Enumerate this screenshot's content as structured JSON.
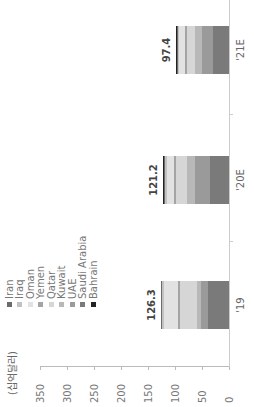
{
  "chart_data": {
    "type": "bar",
    "stacked": true,
    "orientation": "vertical (image rotated 90° counter-clockwise)",
    "title": "",
    "unit_label": "(십억달러)",
    "xlabel": "",
    "ylabel": "(십억달러)",
    "ylim": [
      0,
      350
    ],
    "y_ticks": [
      0,
      50,
      100,
      150,
      200,
      250,
      300,
      350
    ],
    "grid": false,
    "legend_position": "top",
    "categories": [
      "'19",
      "'20E",
      "'21E"
    ],
    "totals": [
      126.3,
      121.2,
      97.4
    ],
    "series": [
      {
        "name": "Saudi Arabia",
        "color": "#7a7a7a",
        "values": [
          38,
          35,
          29
        ]
      },
      {
        "name": "UAE",
        "color": "#9a9a9a",
        "values": [
          13,
          27,
          21
        ]
      },
      {
        "name": "Kuwait",
        "color": "#b8b8b8",
        "values": [
          9,
          16,
          12
        ]
      },
      {
        "name": "Qatar",
        "color": "#d6d6d6",
        "values": [
          30,
          20,
          16
        ]
      },
      {
        "name": "Yemen",
        "color": "#a4a4a4",
        "values": [
          4,
          3,
          3
        ]
      },
      {
        "name": "Oman",
        "color": "#e2e2e2",
        "values": [
          26,
          14,
          11
        ]
      },
      {
        "name": "Iraq",
        "color": "#c2c2c2",
        "values": [
          3,
          3,
          3
        ]
      },
      {
        "name": "Iran",
        "color": "#6b6b6b",
        "values": [
          2,
          2,
          1.4
        ]
      },
      {
        "name": "Bahrain",
        "color": "#222222",
        "values": [
          1.3,
          1.2,
          1
        ]
      }
    ],
    "legend_order": [
      "Iran",
      "Iraq",
      "Oman",
      "Yemen",
      "Qatar",
      "Kuwait",
      "UAE",
      "Saudi Arabia",
      "Bahrain"
    ]
  },
  "labels": {
    "unit": "(십억달러)",
    "y_ticks": [
      "350",
      "300",
      "250",
      "200",
      "150",
      "100",
      "50",
      "0"
    ],
    "categories": [
      "'19",
      "'20E",
      "'21E"
    ],
    "totals": [
      "126.3",
      "121.2",
      "97.4"
    ],
    "legend": [
      "Iran",
      "Iraq",
      "Oman",
      "Yemen",
      "Qatar",
      "Kuwait",
      "UAE",
      "Saudi Arabia",
      "Bahrain"
    ]
  },
  "colors": {
    "legend": [
      "#6b6b6b",
      "#c2c2c2",
      "#e2e2e2",
      "#a4a4a4",
      "#d6d6d6",
      "#b8b8b8",
      "#9a9a9a",
      "#7a7a7a",
      "#222222"
    ]
  }
}
